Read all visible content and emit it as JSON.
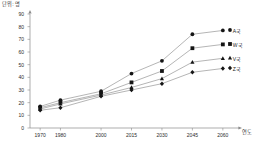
{
  "chart_data": {
    "type": "line",
    "title": "",
    "subtitle": "",
    "xlabel": "연도",
    "ylabel": "단위: 명",
    "xlim": [
      1965,
      2065
    ],
    "ylim": [
      0,
      90
    ],
    "grid": false,
    "legend_position": "right",
    "x": [
      1970,
      1980,
      2000,
      2015,
      2030,
      2045,
      2060
    ],
    "xtick_labels": [
      "1970",
      "1980",
      "2000",
      "2015",
      "2030",
      "2045",
      "2060"
    ],
    "ytick_labels": [
      "0",
      "10",
      "20",
      "30",
      "40",
      "50",
      "60",
      "70",
      "80",
      "90"
    ],
    "ytick_values": [
      0,
      10,
      20,
      30,
      40,
      50,
      60,
      70,
      80,
      90
    ],
    "series": [
      {
        "name": "A국",
        "marker": "circle",
        "values": [
          17,
          22,
          29,
          43,
          53,
          74,
          77
        ]
      },
      {
        "name": "W국",
        "marker": "square",
        "values": [
          16,
          20,
          27,
          36,
          45,
          63,
          66
        ]
      },
      {
        "name": "V국",
        "marker": "triangle",
        "values": [
          15,
          19,
          26,
          32,
          39,
          52,
          55
        ]
      },
      {
        "name": "Z국",
        "marker": "diamond",
        "values": [
          14,
          16,
          25,
          30,
          35,
          44,
          47
        ]
      }
    ]
  },
  "legend": {
    "entries": [
      {
        "label": "A국"
      },
      {
        "label": "W국"
      },
      {
        "label": "V국"
      },
      {
        "label": "Z국"
      }
    ]
  },
  "axes": {
    "y_unit_label": "단위: 명",
    "x_unit_label": "연도"
  }
}
